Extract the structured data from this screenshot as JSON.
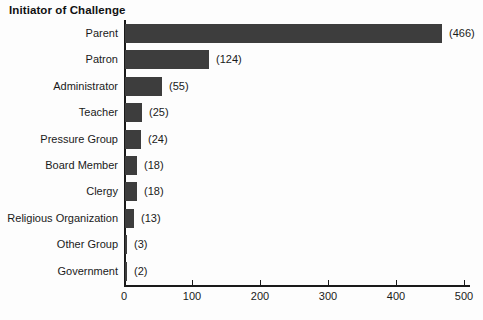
{
  "title": "Initiator of Challenge",
  "chart_data": {
    "type": "bar",
    "orientation": "horizontal",
    "title": "Initiator of Challenge",
    "categories": [
      "Parent",
      "Patron",
      "Administrator",
      "Teacher",
      "Pressure Group",
      "Board Member",
      "Clergy",
      "Religious Organization",
      "Other Group",
      "Government"
    ],
    "values": [
      466,
      124,
      55,
      25,
      24,
      18,
      18,
      13,
      3,
      2
    ],
    "value_labels": [
      "(466)",
      "(124)",
      "(55)",
      "(25)",
      "(24)",
      "(18)",
      "(18)",
      "(13)",
      "(3)",
      "(2)"
    ],
    "xlabel": "",
    "ylabel": "",
    "xlim": [
      0,
      500
    ],
    "x_ticks": [
      0,
      100,
      200,
      300,
      400,
      500
    ],
    "grid": false,
    "legend": "none",
    "bar_color": "#3d3d3d",
    "axis_color": "#1a1a1a",
    "text_color": "#1a1a1a",
    "background": "#fdfdfd"
  }
}
